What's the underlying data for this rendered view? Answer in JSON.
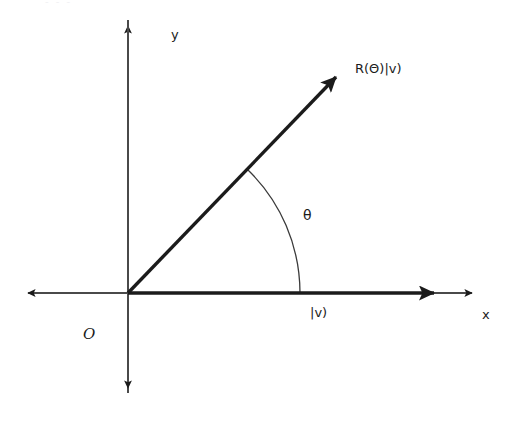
{
  "figure": {
    "title_fragment": "- - -",
    "background_color": "#ffffff",
    "stroke_color": "#1b1b1b",
    "axis_color": "#4a4a4a",
    "width": 520,
    "height": 430
  },
  "axes": {
    "origin_label": "O",
    "x_label": "x",
    "y_label": "y",
    "origin": {
      "x": 128,
      "y": 293
    },
    "x_axis": {
      "x_start": 22,
      "x_end": 478,
      "y": 293
    },
    "y_axis": {
      "x": 128,
      "y_start": 20,
      "y_end": 393
    }
  },
  "vectors": [
    {
      "name": "input-state-vector",
      "label": "|v)",
      "from": {
        "x": 128,
        "y": 293
      },
      "to": {
        "x": 450,
        "y": 293
      },
      "angle_deg": 0
    },
    {
      "name": "rotated-state-vector",
      "label": "R(Θ)|v)",
      "from": {
        "x": 128,
        "y": 293
      },
      "to": {
        "x": 347,
        "y": 66
      },
      "angle_deg": 46
    }
  ],
  "angle_arc": {
    "label": "θ",
    "radius": 172,
    "start_deg": 0,
    "end_deg": 46
  }
}
